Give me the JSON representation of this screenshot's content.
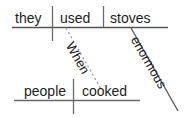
{
  "diagram": {
    "type": "sentence-diagram",
    "style": "reed-kellogg",
    "sentence": "When people cooked, they used enormous stoves.",
    "canvas": {
      "width": 187,
      "height": 117,
      "background": "#ffffff"
    },
    "colors": {
      "text": "#1c1c1c",
      "line": "#555555",
      "dotted_line": "#8a8a8a"
    },
    "main_clause": {
      "subject": "they",
      "verb": "used",
      "direct_object": "stoves",
      "baseline": {
        "x1": 12,
        "y1": 27,
        "x2": 168,
        "y2": 27
      },
      "subject_verb_divider": {
        "x": 52,
        "y1": 6,
        "y2": 40,
        "crosses_baseline": true
      },
      "verb_object_divider": {
        "x": 103,
        "y1": 6,
        "y2": 27,
        "crosses_baseline": false
      }
    },
    "subordinate_clause": {
      "subject": "people",
      "verb": "cooked",
      "baseline": {
        "x1": 14,
        "y1": 100,
        "x2": 140,
        "y2": 100
      },
      "subject_verb_divider": {
        "x": 73,
        "y1": 79,
        "y2": 113,
        "crosses_baseline": true
      }
    },
    "connectors": [
      {
        "label": "When",
        "role": "subordinating-conjunction",
        "line_style": "dotted",
        "x1": 66,
        "y1": 28,
        "x2": 101,
        "y2": 89
      },
      {
        "label": "enormous",
        "role": "adjective-modifier",
        "line_style": "solid",
        "x1": 131,
        "y1": 28,
        "x2": 178,
        "y2": 111
      }
    ]
  }
}
